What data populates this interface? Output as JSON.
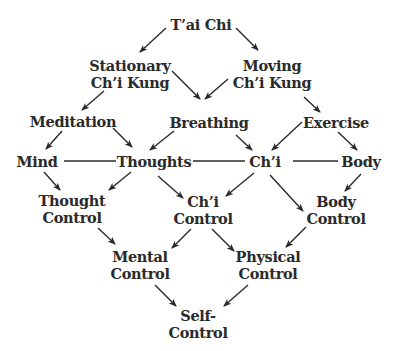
{
  "diagram": {
    "nodes": [
      {
        "id": "tai-chi",
        "lines": [
          "T’ai Chi"
        ],
        "x": 201,
        "y": 16
      },
      {
        "id": "stationary-chi-kung",
        "lines": [
          "Stationary",
          "Ch’i Kung"
        ],
        "x": 130,
        "y": 57
      },
      {
        "id": "moving-chi-kung",
        "lines": [
          "Moving",
          "Ch’i Kung"
        ],
        "x": 272,
        "y": 57
      },
      {
        "id": "meditation",
        "lines": [
          "Meditation"
        ],
        "x": 73,
        "y": 113
      },
      {
        "id": "breathing",
        "lines": [
          "Breathing"
        ],
        "x": 209,
        "y": 114
      },
      {
        "id": "exercise",
        "lines": [
          "Exercise"
        ],
        "x": 336,
        "y": 114
      },
      {
        "id": "mind",
        "lines": [
          "Mind"
        ],
        "x": 37,
        "y": 153
      },
      {
        "id": "thoughts",
        "lines": [
          "Thoughts"
        ],
        "x": 154,
        "y": 153
      },
      {
        "id": "chi",
        "lines": [
          "Ch’i"
        ],
        "x": 265,
        "y": 153
      },
      {
        "id": "body",
        "lines": [
          "Body"
        ],
        "x": 361,
        "y": 153
      },
      {
        "id": "thought-control",
        "lines": [
          "Thought",
          "Control"
        ],
        "x": 72,
        "y": 192
      },
      {
        "id": "chi-control",
        "lines": [
          "Ch’i",
          "Control"
        ],
        "x": 203,
        "y": 193
      },
      {
        "id": "body-control",
        "lines": [
          "Body",
          "Control"
        ],
        "x": 336,
        "y": 193
      },
      {
        "id": "mental-control",
        "lines": [
          "Mental",
          "Control"
        ],
        "x": 140,
        "y": 248
      },
      {
        "id": "physical-control",
        "lines": [
          "Physical",
          "Control"
        ],
        "x": 268,
        "y": 248
      },
      {
        "id": "self-control",
        "lines": [
          "Self-",
          "Control"
        ],
        "x": 198,
        "y": 307
      }
    ],
    "arrows": [
      {
        "from": "tai-chi",
        "to": "stationary-chi-kung",
        "x1": 166,
        "y1": 28,
        "x2": 140,
        "y2": 52
      },
      {
        "from": "tai-chi",
        "to": "moving-chi-kung",
        "x1": 236,
        "y1": 28,
        "x2": 258,
        "y2": 50
      },
      {
        "from": "stationary-chi-kung",
        "to": "breathing",
        "x1": 172,
        "y1": 71,
        "x2": 200,
        "y2": 99
      },
      {
        "from": "moving-chi-kung",
        "to": "breathing",
        "x1": 228,
        "y1": 79,
        "x2": 205,
        "y2": 99
      },
      {
        "from": "stationary-chi-kung",
        "to": "meditation",
        "x1": 104,
        "y1": 91,
        "x2": 82,
        "y2": 110
      },
      {
        "from": "moving-chi-kung",
        "to": "exercise",
        "x1": 304,
        "y1": 97,
        "x2": 320,
        "y2": 112
      },
      {
        "from": "meditation",
        "to": "mind",
        "x1": 62,
        "y1": 131,
        "x2": 46,
        "y2": 149
      },
      {
        "from": "meditation",
        "to": "thoughts",
        "x1": 113,
        "y1": 128,
        "x2": 132,
        "y2": 147
      },
      {
        "from": "breathing",
        "to": "thoughts",
        "x1": 174,
        "y1": 131,
        "x2": 150,
        "y2": 150
      },
      {
        "from": "breathing",
        "to": "chi",
        "x1": 236,
        "y1": 135,
        "x2": 252,
        "y2": 150
      },
      {
        "from": "exercise",
        "to": "chi",
        "x1": 302,
        "y1": 122,
        "x2": 272,
        "y2": 150
      },
      {
        "from": "exercise",
        "to": "body",
        "x1": 338,
        "y1": 132,
        "x2": 357,
        "y2": 150
      },
      {
        "from": "mind",
        "to": "thought-control",
        "x1": 44,
        "y1": 172,
        "x2": 60,
        "y2": 190
      },
      {
        "from": "thoughts",
        "to": "thought-control",
        "x1": 131,
        "y1": 172,
        "x2": 109,
        "y2": 190
      },
      {
        "from": "thoughts",
        "to": "chi-control",
        "x1": 158,
        "y1": 176,
        "x2": 183,
        "y2": 198
      },
      {
        "from": "chi",
        "to": "chi-control",
        "x1": 254,
        "y1": 173,
        "x2": 226,
        "y2": 196
      },
      {
        "from": "chi",
        "to": "body-control",
        "x1": 270,
        "y1": 175,
        "x2": 303,
        "y2": 211
      },
      {
        "from": "body",
        "to": "body-control",
        "x1": 361,
        "y1": 174,
        "x2": 345,
        "y2": 191
      },
      {
        "from": "thought-control",
        "to": "mental-control",
        "x1": 98,
        "y1": 228,
        "x2": 115,
        "y2": 244
      },
      {
        "from": "chi-control",
        "to": "mental-control",
        "x1": 191,
        "y1": 229,
        "x2": 172,
        "y2": 248
      },
      {
        "from": "chi-control",
        "to": "physical-control",
        "x1": 212,
        "y1": 229,
        "x2": 234,
        "y2": 251
      },
      {
        "from": "body-control",
        "to": "physical-control",
        "x1": 306,
        "y1": 227,
        "x2": 286,
        "y2": 247
      },
      {
        "from": "mental-control",
        "to": "self-control",
        "x1": 155,
        "y1": 285,
        "x2": 176,
        "y2": 306
      },
      {
        "from": "physical-control",
        "to": "self-control",
        "x1": 248,
        "y1": 285,
        "x2": 224,
        "y2": 306
      }
    ],
    "links": [
      {
        "from": "mind",
        "to": "thoughts",
        "x1": 64,
        "y1": 161,
        "x2": 116,
        "y2": 161
      },
      {
        "from": "thoughts",
        "to": "chi",
        "x1": 193,
        "y1": 161,
        "x2": 245,
        "y2": 161
      },
      {
        "from": "chi",
        "to": "body",
        "x1": 293,
        "y1": 161,
        "x2": 338,
        "y2": 161
      }
    ],
    "colors": {
      "ink": "#2a2a2a",
      "background": "#ffffff"
    }
  }
}
